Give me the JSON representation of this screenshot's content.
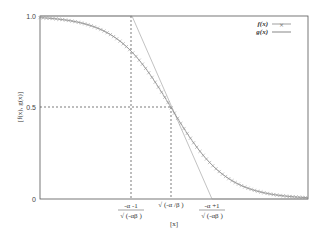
{
  "chart_data": {
    "type": "line",
    "title": "",
    "xlabel": "[x]",
    "ylabel": "[f(x), g(x)]",
    "ylim": [
      0,
      1.0
    ],
    "yticks": [
      "0",
      "0.5",
      "1.0"
    ],
    "xticks": [
      {
        "numerator": "-α -1",
        "denominator": "√(-αβ)"
      },
      {
        "label": "√(-α/β)"
      },
      {
        "numerator": "-α +1",
        "denominator": "√(-αβ)"
      }
    ],
    "grid": false,
    "legend_position": "top-right",
    "series": [
      {
        "name": "f(x)",
        "style": "line with x markers",
        "description": "decreasing sigmoid from 1.0 to 0, passing 0.5 at x = √(-α/β)"
      },
      {
        "name": "g(x)",
        "style": "thin solid line",
        "description": "tangent line at inflection point, reaching 1 at (-α-1)/√(-αβ) and 0 at (-α+1)/√(-αβ)"
      }
    ],
    "annotations": [
      "dashed vertical at x=(-α-1)/√(-αβ)",
      "dashed vertical at x=√(-α/β) up to y=0.5",
      "dashed horizontal at y=0.5"
    ]
  },
  "legend": {
    "f": "f(x)",
    "g": "g(x)"
  },
  "axes": {
    "xlabel": "[x]",
    "ylabel": "[f(x), g(x)]",
    "y_top": "1.0",
    "y_mid": "0.5",
    "y_bottom": "0",
    "x1_num": "-α -1",
    "x1_den": "√ (-αβ  )",
    "x2": "√ (-α /β  )",
    "x3_num": "-α +1",
    "x3_den": "√ (-αβ  )"
  }
}
